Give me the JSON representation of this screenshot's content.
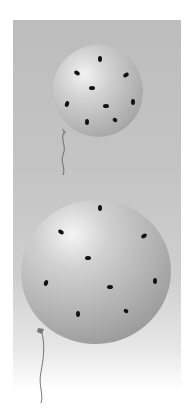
{
  "scene": {
    "description": "Two gray balloons with black spots on a gray gradient backdrop",
    "colors": {
      "backdrop": "#c2c2c2",
      "balloon": "#b8b8b8",
      "spot": "#111111",
      "string": "#555555"
    },
    "balloons": [
      {
        "name": "small",
        "cx": 98,
        "cy": 90,
        "rx": 45,
        "ry": 45,
        "spots": 9
      },
      {
        "name": "large",
        "cx": 96,
        "cy": 271,
        "rx": 75,
        "ry": 73,
        "spots": 9
      }
    ]
  }
}
